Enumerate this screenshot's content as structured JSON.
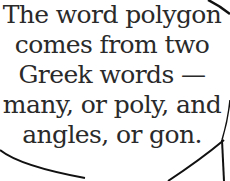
{
  "speech_bubble": {
    "lines": [
      "The word polygon",
      "comes from two",
      "Greek words —",
      "many, or poly, and",
      "angles, or gon."
    ],
    "text_color": "#2a2a2a",
    "outline_color": "#111111"
  }
}
